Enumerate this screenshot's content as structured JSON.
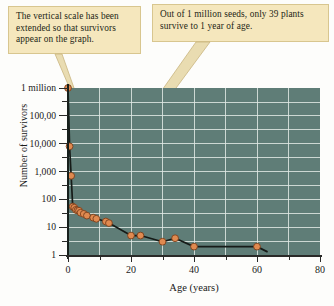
{
  "callouts": [
    {
      "id": "vertical-scale-note",
      "text": "The vertical scale has been extended so that survivors appear on the graph."
    },
    {
      "id": "survivor-count-note",
      "text": "Out of 1 million seeds, only 39 plants survive to 1 year of age."
    }
  ],
  "colors": {
    "plot_background": "#5f7d77",
    "gridline": "#dfe8e3",
    "marker_fill": "#e08a50",
    "marker_stroke": "#7a3f1c",
    "series_line": "#161b18",
    "callout_fill": "#f5e7bd",
    "callout_border": "#d8c68f",
    "leader_line": "#e4cf92"
  },
  "chart_data": {
    "type": "line",
    "title": "",
    "subtitle": "",
    "xlabel": "Age (years)",
    "ylabel": "Number of survivors",
    "grid": true,
    "legend": "none",
    "xlim": [
      0,
      80
    ],
    "xticks": [
      0,
      20,
      40,
      60,
      80
    ],
    "xticklabels": [
      "0",
      "20",
      "40",
      "60",
      "80"
    ],
    "yscale": "log",
    "ylim": [
      1,
      1000000
    ],
    "yticks": [
      1000000,
      100000,
      10000,
      1000,
      100,
      10,
      1
    ],
    "yticklabels": [
      "1 million",
      "100,00",
      "10,000",
      "1,000",
      "100",
      "10",
      "1"
    ],
    "series": [
      {
        "name": "Survivorship",
        "x": [
          0,
          0.5,
          1,
          1.5,
          2,
          2.5,
          3,
          3.5,
          4,
          5,
          6,
          8,
          9,
          12,
          13,
          20,
          23,
          30,
          34,
          40,
          60
        ],
        "y": [
          1000000,
          8000,
          700,
          55,
          50,
          42,
          40,
          39,
          33,
          30,
          26,
          22,
          20,
          16,
          14,
          5,
          5,
          3,
          4,
          2,
          2
        ]
      }
    ],
    "annotations": [
      "The vertical scale has been extended so that survivors appear on the graph.",
      "Out of 1 million seeds, only 39 plants survive to 1 year of age."
    ]
  }
}
